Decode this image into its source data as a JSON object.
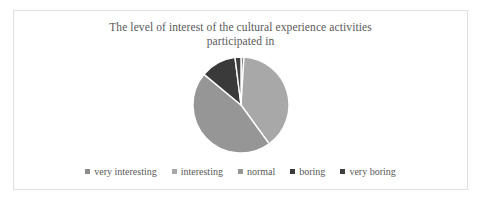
{
  "chart_data": {
    "type": "pie",
    "title": "The level of interest of the cultural experience activities participated in",
    "title_line1": "The level of interest of the cultural experience activities",
    "title_line2": "participated in",
    "xlabel": "",
    "ylabel": "",
    "legend_position": "bottom",
    "grid": false,
    "start_angle_deg": 0,
    "direction": "clockwise",
    "categories": [
      "very interesting",
      "interesting",
      "normal",
      "boring",
      "very boring"
    ],
    "values": [
      1,
      39,
      46,
      12,
      2
    ],
    "slice_angles_deg": [
      3.6,
      140.4,
      165.6,
      43.2,
      7.2
    ],
    "colors": [
      "#8c8c8c",
      "#a8a8a8",
      "#969696",
      "#3a3a3a",
      "#404040"
    ],
    "slice_separator_color": "#ffffff",
    "series": [
      {
        "name": "level of interest",
        "values": [
          1,
          39,
          46,
          12,
          2
        ]
      }
    ]
  },
  "frame": {
    "border_color": "#e0e0e0",
    "background": "#ffffff"
  },
  "title": {
    "line1": "The level of interest of the cultural experience activities",
    "line2": "participated in",
    "color": "#595959"
  },
  "legend": {
    "items": [
      {
        "label": "very interesting",
        "color": "#8c8c8c"
      },
      {
        "label": "interesting",
        "color": "#a8a8a8"
      },
      {
        "label": "normal",
        "color": "#969696"
      },
      {
        "label": "boring",
        "color": "#3a3a3a"
      },
      {
        "label": "very boring",
        "color": "#404040"
      }
    ]
  }
}
